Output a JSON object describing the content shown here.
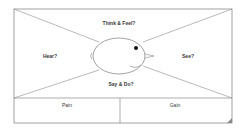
{
  "diagram": {
    "quadrants": {
      "top": "Think & Feel?",
      "left": "Hear?",
      "right": "See?",
      "bottom": "Say & Do?"
    },
    "bottom_row": {
      "left": "Pain",
      "right": "Gain"
    },
    "center_figure": "head-icon",
    "colors": {
      "line": "#8a8a8a",
      "text": "#3a3a3a",
      "background": "#ffffff"
    }
  }
}
